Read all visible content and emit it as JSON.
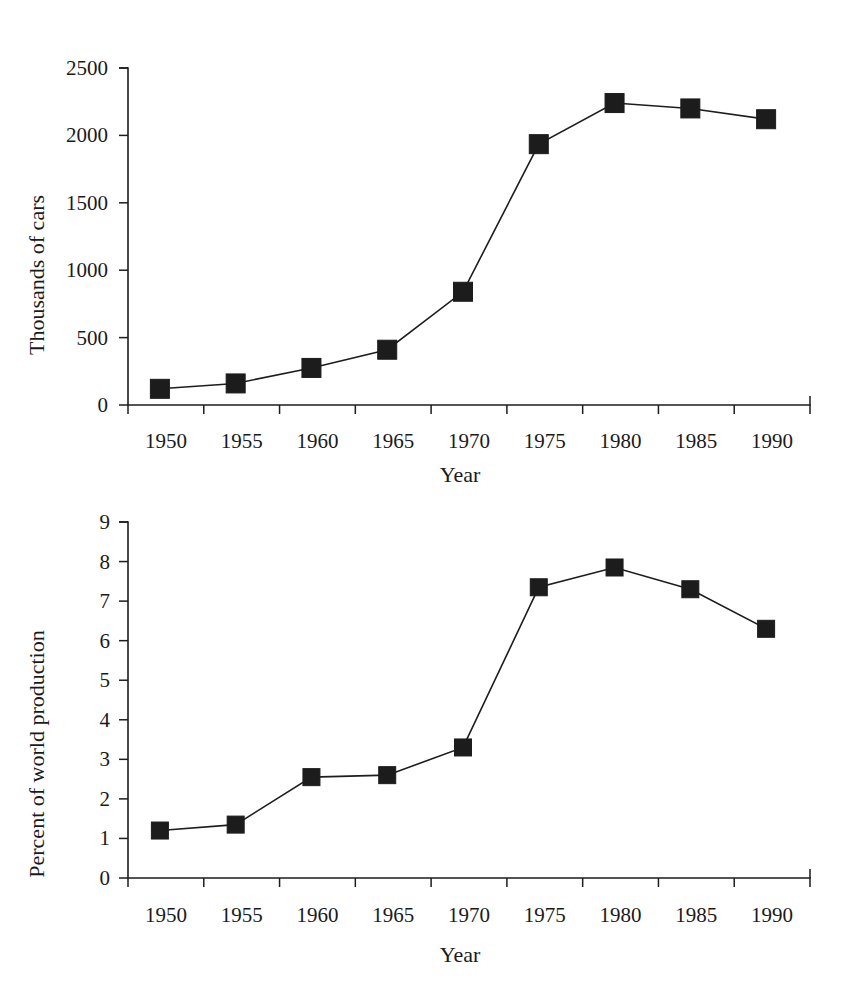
{
  "page": {
    "background": "#ffffff",
    "ink_color": "#1a1a1a"
  },
  "chart_data": [
    {
      "id": "cars",
      "type": "line",
      "title": "",
      "xlabel": "Year",
      "ylabel": "Thousands of cars",
      "categories": [
        "1950",
        "1955",
        "1960",
        "1965",
        "1970",
        "1975",
        "1980",
        "1985",
        "1990"
      ],
      "x": [
        1950,
        1955,
        1960,
        1965,
        1970,
        1975,
        1980,
        1985,
        1990
      ],
      "values": [
        120,
        160,
        275,
        410,
        840,
        1935,
        2240,
        2200,
        2120
      ],
      "ylim": [
        0,
        2500
      ],
      "yticks": [
        0,
        500,
        1000,
        1500,
        2000,
        2500
      ],
      "ytick_labels": [
        "0",
        "500",
        "1000",
        "1500",
        "2000",
        "2500"
      ],
      "xlim": [
        1947.5,
        1992.5
      ],
      "grid": false,
      "legend": "none",
      "marker": "square",
      "marker_color": "#1c1c1c",
      "line_color": "#1d1d1d"
    },
    {
      "id": "percent",
      "type": "line",
      "title": "",
      "xlabel": "Year",
      "ylabel": "Percent of world production",
      "categories": [
        "1950",
        "1955",
        "1960",
        "1965",
        "1970",
        "1975",
        "1980",
        "1985",
        "1990"
      ],
      "x": [
        1950,
        1955,
        1960,
        1965,
        1970,
        1975,
        1980,
        1985,
        1990
      ],
      "values": [
        1.2,
        1.35,
        2.55,
        2.6,
        3.3,
        7.35,
        7.85,
        7.3,
        6.3
      ],
      "ylim": [
        0,
        9
      ],
      "yticks": [
        0,
        1,
        2,
        3,
        4,
        5,
        6,
        7,
        8,
        9
      ],
      "ytick_labels": [
        "0",
        "1",
        "2",
        "3",
        "4",
        "5",
        "6",
        "7",
        "8",
        "9"
      ],
      "xlim": [
        1947.5,
        1992.5
      ],
      "grid": false,
      "legend": "none",
      "marker": "square",
      "marker_color": "#1c1c1c",
      "line_color": "#1d1d1d"
    }
  ]
}
